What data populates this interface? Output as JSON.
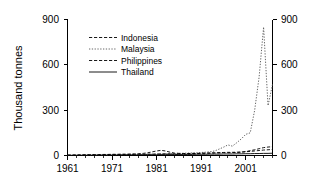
{
  "chart_data": {
    "type": "line",
    "title": "",
    "xlabel": "",
    "ylabel": "Thousand tonnes",
    "xlim": [
      1961,
      2007
    ],
    "ylim": [
      0,
      900
    ],
    "yticks": [
      0,
      300,
      600,
      900
    ],
    "xticks": [
      1961,
      1971,
      1981,
      1991,
      2001
    ],
    "x_minor_tick_interval": 2,
    "grid": false,
    "dual_y_axis": true,
    "right_axis_ticks": [
      0,
      300,
      600,
      900
    ],
    "legend_position": "upper-left-inside",
    "x": [
      1961,
      1962,
      1963,
      1964,
      1965,
      1966,
      1967,
      1968,
      1969,
      1970,
      1971,
      1972,
      1973,
      1974,
      1975,
      1976,
      1977,
      1978,
      1979,
      1980,
      1981,
      1982,
      1983,
      1984,
      1985,
      1986,
      1987,
      1988,
      1989,
      1990,
      1991,
      1992,
      1993,
      1994,
      1995,
      1996,
      1997,
      1998,
      1999,
      2000,
      2001,
      2002,
      2003,
      2004,
      2005,
      2006,
      2007
    ],
    "series": [
      {
        "name": "Indonesia",
        "linestyle": "dashed",
        "color": "#000000",
        "values": [
          2,
          2,
          3,
          3,
          3,
          4,
          4,
          4,
          5,
          5,
          5,
          6,
          6,
          6,
          7,
          7,
          8,
          8,
          9,
          9,
          10,
          11,
          12,
          12,
          11,
          11,
          12,
          12,
          13,
          13,
          14,
          15,
          15,
          16,
          17,
          18,
          18,
          19,
          20,
          22,
          26,
          32,
          38,
          45,
          52,
          56,
          58
        ]
      },
      {
        "name": "Malaysia",
        "linestyle": "dotted",
        "color": "#555555",
        "values": [
          1,
          1,
          1,
          2,
          2,
          2,
          2,
          3,
          3,
          3,
          4,
          4,
          5,
          5,
          6,
          6,
          7,
          7,
          8,
          9,
          10,
          11,
          12,
          13,
          13,
          14,
          15,
          16,
          17,
          18,
          20,
          22,
          25,
          30,
          42,
          55,
          70,
          62,
          85,
          110,
          140,
          150,
          300,
          520,
          850,
          330,
          470
        ]
      },
      {
        "name": "Philippines",
        "linestyle": "dashed",
        "color": "#000000",
        "values": [
          3,
          3,
          4,
          4,
          5,
          5,
          6,
          6,
          7,
          7,
          8,
          8,
          9,
          9,
          10,
          11,
          12,
          14,
          18,
          24,
          30,
          34,
          30,
          22,
          16,
          14,
          13,
          13,
          14,
          14,
          15,
          16,
          17,
          18,
          19,
          20,
          21,
          21,
          22,
          23,
          25,
          27,
          30,
          33,
          36,
          38,
          40
        ]
      },
      {
        "name": "Thailand",
        "linestyle": "solid",
        "color": "#000000",
        "values": [
          1,
          1,
          1,
          1,
          2,
          2,
          2,
          2,
          2,
          3,
          3,
          3,
          3,
          4,
          4,
          4,
          4,
          5,
          5,
          5,
          5,
          6,
          6,
          6,
          6,
          7,
          7,
          7,
          7,
          8,
          8,
          8,
          9,
          9,
          9,
          10,
          10,
          10,
          11,
          11,
          12,
          12,
          13,
          13,
          14,
          14,
          15
        ]
      }
    ]
  },
  "axis": {
    "ylabel": "Thousand tonnes",
    "ytick_labels": [
      "0",
      "300",
      "600",
      "900"
    ],
    "xtick_labels": [
      "1961",
      "1971",
      "1981",
      "1991",
      "2001"
    ],
    "right_ytick_labels": [
      "0",
      "300",
      "600",
      "900"
    ]
  },
  "legend": {
    "items": [
      {
        "label": "Indonesia"
      },
      {
        "label": "Malaysia"
      },
      {
        "label": "Philippines"
      },
      {
        "label": "Thailand"
      }
    ]
  }
}
